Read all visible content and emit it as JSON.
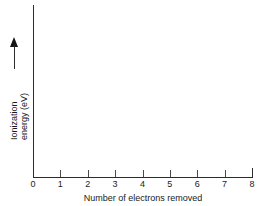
{
  "figure": {
    "background_color": "#ffffff",
    "axis_color": "#2b2b2b",
    "text_color": "#1a1a1a"
  },
  "chart_data": {
    "type": "line",
    "title": "",
    "subtitle": "",
    "xlabel": "Number of electrons removed",
    "ylabel": "Ionization energy (eV)",
    "ylabel_lines": [
      "Ionization",
      "energy (eV)"
    ],
    "x_tick_labels": [
      "0",
      "1",
      "2",
      "3",
      "4",
      "5",
      "6",
      "7",
      "8"
    ],
    "x_tick_values": [
      0,
      1,
      2,
      3,
      4,
      5,
      6,
      7,
      8
    ],
    "y_tick_labels": [],
    "xlim": [
      0,
      8
    ],
    "ylim": null,
    "grid": false,
    "legend": null,
    "series": [],
    "annotations": [
      {
        "name": "y-axis-direction-arrow",
        "symbol": "upward-arrow",
        "meaning": "increasing ionization energy"
      }
    ]
  },
  "icons": {
    "up_arrow": "up-arrow-icon"
  }
}
